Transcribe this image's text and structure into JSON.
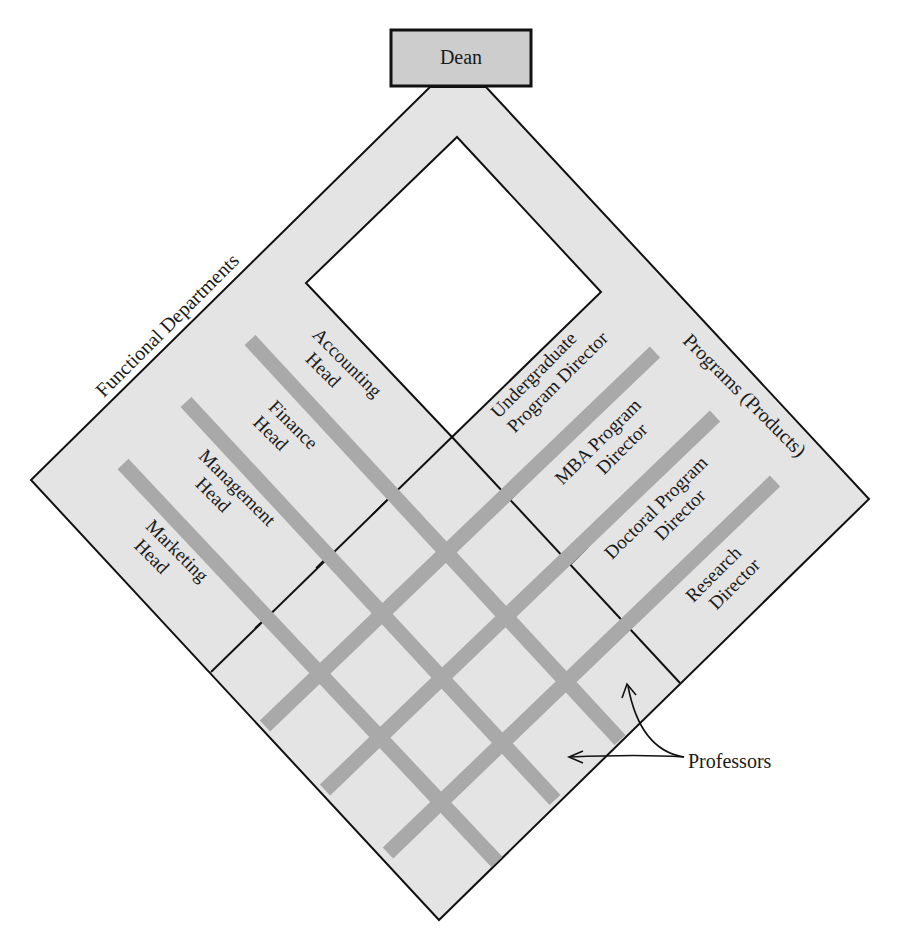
{
  "colors": {
    "diamond_fill": "#e4e4e4",
    "bar": "#a9a9a9",
    "dean_fill": "#cdcdcd",
    "line": "#111111",
    "inner_window": "#ffffff"
  },
  "top": {
    "dean": "Dean"
  },
  "functional": {
    "title": "Functional Departments",
    "heads": [
      {
        "line1": "Accounting",
        "line2": "Head"
      },
      {
        "line1": "Finance",
        "line2": "Head"
      },
      {
        "line1": "Management",
        "line2": "Head"
      },
      {
        "line1": "Marketing",
        "line2": "Head"
      }
    ]
  },
  "programs": {
    "title": "Programs (Products)",
    "directors": [
      {
        "line1": "Undergraduate",
        "line2": "Program Director"
      },
      {
        "line1": "MBA Program",
        "line2": "Director"
      },
      {
        "line1": "Doctoral Program",
        "line2": "Director"
      },
      {
        "line1": "Research",
        "line2": "Director"
      }
    ]
  },
  "callout": {
    "label": "Professors"
  }
}
